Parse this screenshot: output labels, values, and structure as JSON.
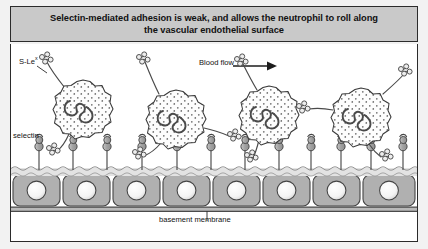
{
  "figure": {
    "title_line1": "Selectin-mediated adhesion is weak, and allows the neutrophil to roll along",
    "title_line2": "the vascular endothelial surface"
  },
  "labels": {
    "ligand": "S-Le",
    "ligand_superscript": "x",
    "selectin": "selectin",
    "blood_flow": "Blood flow",
    "basement_membrane": "basement membrane"
  },
  "colors": {
    "banner_background": "#c9c9c9",
    "border": "#2b2b2b",
    "page_background": "#f2f2f2",
    "panel_background": "#ffffff",
    "endothelial_cell_fill": "#b0b0b0",
    "endothelial_nucleus_fill": "#fbfbfb",
    "neutrophil_fill": "#fdfdfd",
    "neutrophil_stroke": "#3a3a3a",
    "selectin_fill": "#a9a9a9",
    "text": "#111111"
  },
  "diagram": {
    "type": "biology-schematic",
    "flow_direction": "left-to-right",
    "neutrophil_count": 4,
    "endothelial_cell_count": 8,
    "selectin_count": 12,
    "neutrophils": [
      {
        "index": 1,
        "cx": 72,
        "cy": 66,
        "r": 30,
        "label": "neutrophil-1"
      },
      {
        "index": 2,
        "cx": 165,
        "cy": 76,
        "r": 30,
        "label": "neutrophil-2"
      },
      {
        "index": 3,
        "cx": 258,
        "cy": 72,
        "r": 28,
        "label": "neutrophil-3"
      },
      {
        "index": 4,
        "cx": 350,
        "cy": 74,
        "r": 29,
        "label": "neutrophil-4"
      }
    ],
    "selectin_x_positions": [
      28,
      62,
      96,
      131,
      166,
      200,
      234,
      268,
      300,
      330,
      360,
      390
    ],
    "endothelial_cells": [
      {
        "index": 1,
        "x": 2
      },
      {
        "index": 2,
        "x": 52
      },
      {
        "index": 3,
        "x": 102
      },
      {
        "index": 4,
        "x": 152
      },
      {
        "index": 5,
        "x": 202
      },
      {
        "index": 6,
        "x": 252
      },
      {
        "index": 7,
        "x": 302
      },
      {
        "index": 8,
        "x": 352
      }
    ],
    "membrane_surface_y": 125,
    "basement_membrane_y": 168
  }
}
